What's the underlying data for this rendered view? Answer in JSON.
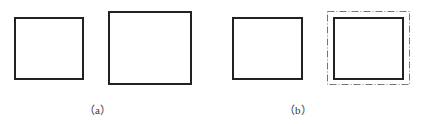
{
  "figure": {
    "panels": [
      {
        "id": "a",
        "label": "（a）",
        "label_letter": "a",
        "shapes": [
          {
            "name": "small-square",
            "x": 14,
            "y": 17,
            "w": 70,
            "h": 63,
            "stroke": "solid"
          },
          {
            "name": "large-square",
            "x": 108,
            "y": 11,
            "w": 84,
            "h": 74,
            "stroke": "solid"
          }
        ]
      },
      {
        "id": "b",
        "label": "（b）",
        "label_letter": "b",
        "shapes": [
          {
            "name": "square",
            "x": 232,
            "y": 17,
            "w": 71,
            "h": 63,
            "stroke": "solid"
          },
          {
            "name": "square-with-offset",
            "x": 333,
            "y": 17,
            "w": 71,
            "h": 63,
            "stroke": "solid"
          },
          {
            "name": "offset-outline",
            "x": 327,
            "y": 11,
            "w": 83,
            "h": 74,
            "stroke": "dash-dot"
          }
        ]
      }
    ],
    "colors": {
      "stroke": "#222222",
      "outline": "#777777",
      "label": "#333333",
      "background": "#ffffff"
    }
  }
}
